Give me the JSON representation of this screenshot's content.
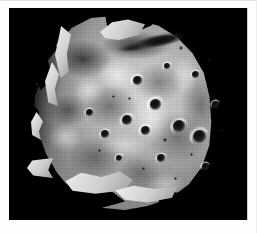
{
  "image": {
    "subject": "phobos-moon",
    "view_description": "Grayscale spacecraft photograph of an irregular, heavily cratered moon lit from the right, set against black space",
    "caption": "",
    "colors": {
      "space_background": "#000000",
      "frame_border": "#fefefe",
      "surface_light": "#d9d9d9",
      "surface_mid": "#a8a8a8",
      "surface_dark": "#555555",
      "crater_shadow": "#090909",
      "limb_highlight": "#f2f2f2"
    },
    "frame": {
      "width": 257,
      "height": 233,
      "plate_left": 9,
      "plate_top": 8,
      "plate_width": 238,
      "plate_height": 212
    },
    "features": {
      "terminator_side": "left",
      "illumination_direction": "from the right",
      "groove_label": "dark elongated groove",
      "limb_ridge_label": "illuminated limb ridge",
      "crater_label": "impact crater"
    },
    "craters": [
      {
        "name": "crater-1",
        "x": 128,
        "y": 72,
        "size": 9
      },
      {
        "name": "crater-2",
        "x": 146,
        "y": 96,
        "size": 11
      },
      {
        "name": "crater-3",
        "x": 118,
        "y": 112,
        "size": 10
      },
      {
        "name": "crater-4",
        "x": 136,
        "y": 122,
        "size": 9
      },
      {
        "name": "crater-5",
        "x": 170,
        "y": 118,
        "size": 12
      },
      {
        "name": "crater-6",
        "x": 190,
        "y": 128,
        "size": 13
      },
      {
        "name": "crater-7",
        "x": 96,
        "y": 126,
        "size": 8
      },
      {
        "name": "crater-8",
        "x": 80,
        "y": 104,
        "size": 7
      },
      {
        "name": "crater-9",
        "x": 158,
        "y": 58,
        "size": 6
      },
      {
        "name": "crater-10",
        "x": 186,
        "y": 66,
        "size": 7
      },
      {
        "name": "crater-11",
        "x": 206,
        "y": 96,
        "size": 7
      },
      {
        "name": "crater-12",
        "x": 152,
        "y": 150,
        "size": 8
      },
      {
        "name": "crater-13",
        "x": 196,
        "y": 158,
        "size": 7
      },
      {
        "name": "crater-14",
        "x": 110,
        "y": 150,
        "size": 6
      }
    ],
    "specks": [
      {
        "x": 172,
        "y": 40,
        "size": 4
      },
      {
        "x": 200,
        "y": 52,
        "size": 3
      },
      {
        "x": 120,
        "y": 90,
        "size": 3
      },
      {
        "x": 156,
        "y": 132,
        "size": 4
      },
      {
        "x": 182,
        "y": 146,
        "size": 3
      },
      {
        "x": 134,
        "y": 160,
        "size": 3
      },
      {
        "x": 104,
        "y": 88,
        "size": 3
      },
      {
        "x": 212,
        "y": 122,
        "size": 3
      },
      {
        "x": 166,
        "y": 170,
        "size": 3
      },
      {
        "x": 90,
        "y": 142,
        "size": 3
      }
    ]
  }
}
